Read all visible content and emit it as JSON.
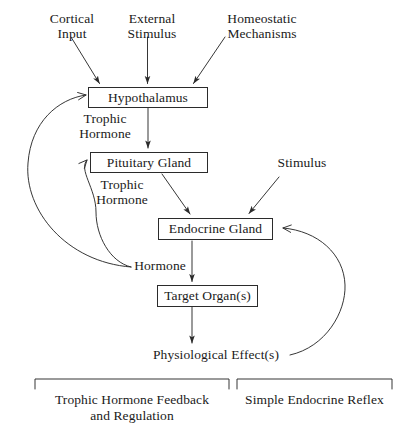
{
  "diagram": {
    "type": "flowchart",
    "background_color": "#ffffff",
    "line_color": "#2b2b2b",
    "text_color": "#1a1a1a"
  },
  "nodes": {
    "hypothalamus": "Hypothalamus",
    "pituitary_gland": "Pituitary Gland",
    "endocrine_gland": "Endocrine Gland",
    "target_organ": "Target Organ(s)"
  },
  "inputs": {
    "cortical_input": "Cortical\nInput",
    "external_stimulus": "External\nStimulus",
    "homeostatic_mechanisms": "Homeostatic\nMechanisms",
    "stimulus": "Stimulus"
  },
  "edge_labels": {
    "trophic_hormone_1": "Trophic\nHormone",
    "trophic_hormone_2": "Trophic\nHormone",
    "hormone": "Hormone"
  },
  "outputs": {
    "physiological_effects": "Physiological Effect(s)"
  },
  "brackets": {
    "left": "Trophic Hormone Feedback\nand Regulation",
    "right": "Simple Endocrine Reflex"
  }
}
